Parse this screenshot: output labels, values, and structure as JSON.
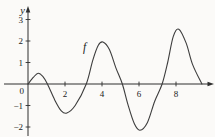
{
  "figure": {
    "background": "#fbfaf8",
    "curve_color": "#3d3d3d",
    "axis_color": "#2e2e2e",
    "label_color": "#1a1a1a",
    "y_axis_label": "y",
    "origin_label": "0",
    "function_label": "f"
  },
  "chart_data": {
    "type": "line",
    "title": "",
    "xlabel": "",
    "ylabel": "y",
    "legend": "none",
    "grid": false,
    "x_range": [
      0,
      9.5
    ],
    "y_range": [
      -2.5,
      3.5
    ],
    "x_ticks": [
      {
        "value": 2,
        "label": "2"
      },
      {
        "value": 4,
        "label": "4"
      },
      {
        "value": 6,
        "label": "6"
      },
      {
        "value": 8,
        "label": "8"
      }
    ],
    "y_ticks": [
      {
        "value": -2,
        "label": "−2"
      },
      {
        "value": -1,
        "label": "−1"
      },
      {
        "value": 1,
        "label": "1"
      },
      {
        "value": 2,
        "label": "2"
      },
      {
        "value": 3,
        "label": "3"
      }
    ],
    "series": [
      {
        "name": "f",
        "points": [
          [
            0,
            0
          ],
          [
            0.3,
            0.32
          ],
          [
            0.55,
            0.5
          ],
          [
            0.8,
            0.35
          ],
          [
            1.05,
            0
          ],
          [
            1.45,
            -0.75
          ],
          [
            1.8,
            -1.25
          ],
          [
            2.1,
            -1.35
          ],
          [
            2.55,
            -1.0
          ],
          [
            3.15,
            0
          ],
          [
            3.5,
            1.1
          ],
          [
            3.8,
            1.8
          ],
          [
            4.05,
            1.95
          ],
          [
            4.4,
            1.6
          ],
          [
            4.75,
            0.75
          ],
          [
            5.1,
            0
          ],
          [
            5.4,
            -0.95
          ],
          [
            5.75,
            -1.85
          ],
          [
            6.05,
            -2.15
          ],
          [
            6.45,
            -1.8
          ],
          [
            6.85,
            -0.8
          ],
          [
            7.25,
            0
          ],
          [
            7.55,
            1.0
          ],
          [
            7.85,
            2.2
          ],
          [
            8.15,
            2.55
          ],
          [
            8.55,
            1.9
          ],
          [
            8.9,
            0.9
          ],
          [
            9.4,
            0
          ]
        ]
      }
    ],
    "key_points": {
      "zeros": [
        0,
        1.05,
        3.15,
        5.1,
        7.25,
        9.4
      ],
      "local_maxima": [
        [
          0.55,
          0.5
        ],
        [
          4.05,
          1.95
        ],
        [
          8.15,
          2.55
        ]
      ],
      "local_minima": [
        [
          2.1,
          -1.35
        ],
        [
          6.05,
          -2.15
        ]
      ]
    }
  }
}
